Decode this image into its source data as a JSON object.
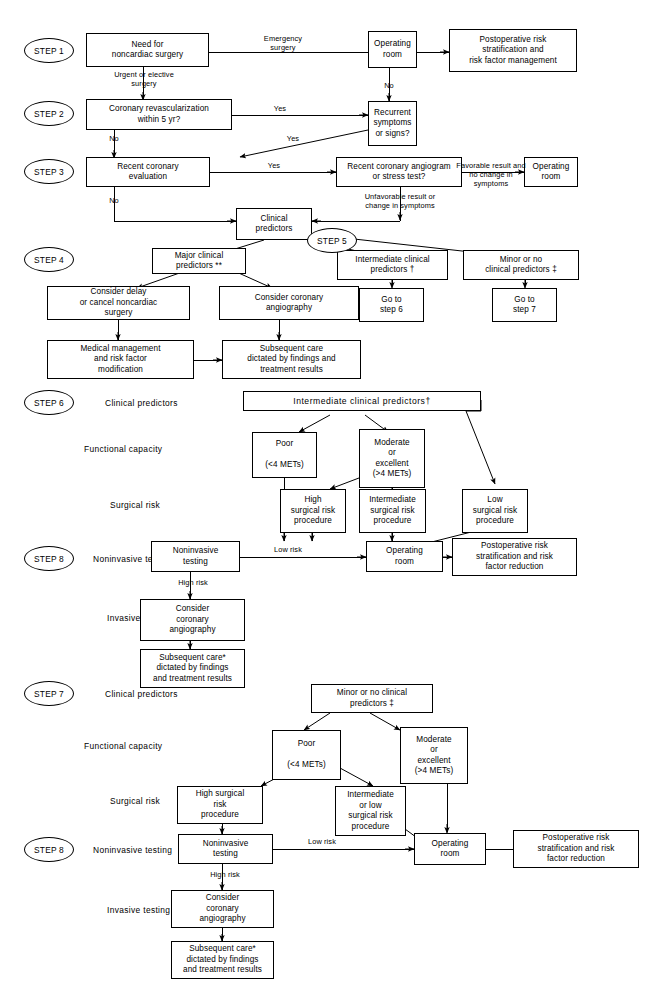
{
  "figure": {
    "type": "clinical-decision-algorithm-flowchart"
  },
  "steps": {
    "s1": "STEP 1",
    "s2": "STEP 2",
    "s3": "STEP 3",
    "s4": "STEP 4",
    "s5": "STEP 5",
    "s6": "STEP 6",
    "s7": "STEP 7",
    "s8a": "STEP 8",
    "s8b": "STEP 8"
  },
  "row_labels": {
    "clinical_predictors_6": "Clinical predictors",
    "functional_capacity_6": "Functional capacity",
    "surgical_risk_6": "Surgical risk",
    "noninvasive_testing_6": "Noninvasive testing",
    "invasive_testing_6": "Invasive testing",
    "clinical_predictors_7": "Clinical predictors",
    "functional_capacity_7": "Functional capacity",
    "surgical_risk_7": "Surgical risk",
    "noninvasive_testing_7": "Noninvasive testing",
    "invasive_testing_7": "Invasive testing"
  },
  "boxes": {
    "need_noncardiac_surgery": "Need for\nnoncardiac surgery",
    "operating_room_1": "Operating\nroom",
    "postop_risk_mgmt": "Postoperative risk\nstratification and\nrisk factor management",
    "coronary_revasc_5yr": "Coronary revascularization\nwithin 5 yr?",
    "recurrent_symptoms": "Recurrent\nsymptoms\nor signs?",
    "recent_coronary_eval": "Recent coronary\nevaluation",
    "recent_angiogram_stress": "Recent coronary angiogram\nor stress test?",
    "operating_room_3": "Operating\nroom",
    "clinical_predictors": "Clinical\npredictors",
    "major_clinical_predictors": "Major clinical\npredictors **",
    "intermediate_clinical_predictors_5": "Intermediate clinical\npredictors †",
    "minor_no_clinical_predictors_5": "Minor or no\nclinical predictors ‡",
    "consider_delay_cancel": "Consider delay\nor cancel noncardiac\nsurgery",
    "consider_coronary_angiography_4": "Consider coronary\nangiography",
    "go_to_step6": "Go to\nstep 6",
    "go_to_step7": "Go to\nstep 7",
    "medical_management": "Medical management\nand risk factor\nmodification",
    "subsequent_care_4": "Subsequent care\ndictated by findings and\ntreatment results",
    "intermediate_clinical_predictors_6": "Intermediate clinical predictors†",
    "poor_6": "Poor\n\n(<4 METs)",
    "moderate_excellent_6": "Moderate\nor\nexcellent\n(>4 METs)",
    "high_surgical_risk_6": "High\nsurgical risk\nprocedure",
    "intermediate_surgical_risk_6": "Intermediate\nsurgical risk\nprocedure",
    "low_surgical_risk_6": "Low\nsurgical risk\nprocedure",
    "noninvasive_testing_6": "Noninvasive\ntesting",
    "operating_room_6": "Operating\nroom",
    "postop_risk_reduction_6": "Postoperative risk\nstratification and risk\nfactor reduction",
    "consider_coronary_angiography_6": "Consider\ncoronary\nangiography",
    "subsequent_care_6": "Subsequent care*\ndictated by findings\nand treatment results",
    "minor_no_clinical_predictors_7": "Minor or no clinical\npredictors ‡",
    "poor_7": "Poor\n\n(<4 METs)",
    "moderate_excellent_7": "Moderate\nor\nexcellent\n(>4 METs)",
    "high_surgical_risk_7": "High surgical\nrisk\nprocedure",
    "intermediate_low_surgical_risk_7": "Intermediate\nor low\nsurgical risk\nprocedure",
    "noninvasive_testing_7": "Noninvasive\ntesting",
    "operating_room_7": "Operating\nroom",
    "postop_risk_reduction_7": "Postoperative risk\nstratification and risk\nfactor reduction",
    "consider_coronary_angiography_7": "Consider\ncoronary\nangiography",
    "subsequent_care_7": "Subsequent care*\ndictated by findings\nand treatment results"
  },
  "edge_labels": {
    "emergency_surgery": "Emergency\nsurgery",
    "no_1": "No",
    "urgent_or_elective": "Urgent or elective\nsurgery",
    "yes_step2": "Yes",
    "no_step2": "No",
    "yes_recurrent": "Yes",
    "yes_step3": "Yes",
    "favorable_result": "Favorable result and\nno change in\nsymptoms",
    "unfavorable_result": "Unfavorable result or\nchange in symptoms",
    "no_step3": "No",
    "low_risk_6": "Low risk",
    "high_risk_6": "High  risk",
    "low_risk_7": "Low risk",
    "high_risk_7": "High  risk"
  },
  "colors": {
    "line": "#000000",
    "background": "#ffffff",
    "text": "#000000"
  }
}
